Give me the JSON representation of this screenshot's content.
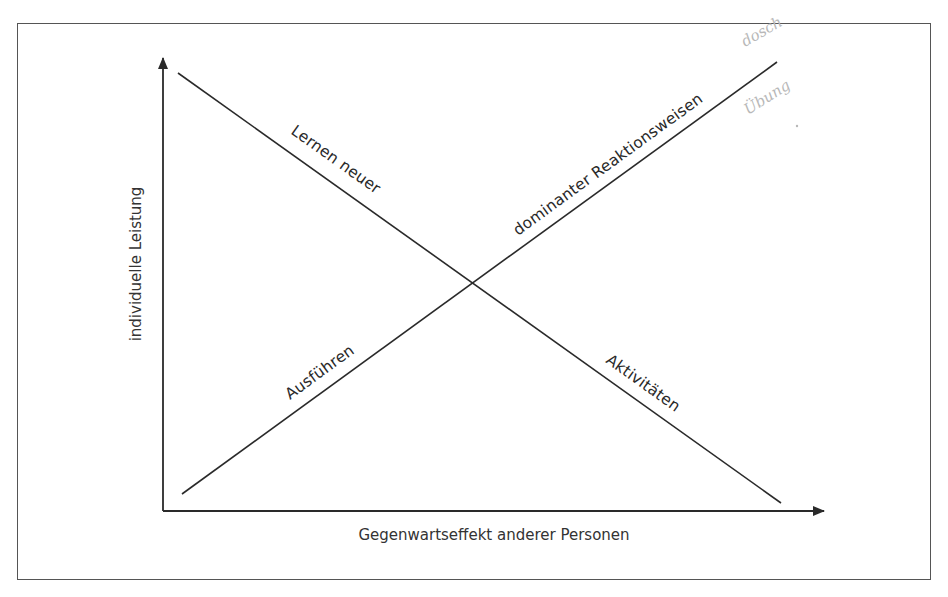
{
  "figure": {
    "x_axis_label": "Gegenwartseffekt anderer Personen",
    "y_axis_label": "individuelle Leistung",
    "lines": [
      {
        "id": "lernen",
        "label_upper": "Lernen neuer",
        "label_lower": "Aktivitäten",
        "full_label": "Lernen neuer Aktivitäten",
        "trend": "decreasing"
      },
      {
        "id": "ausfuehren",
        "label_lower": "Ausführen",
        "label_upper": "dominanter Reaktionsweisen",
        "full_label": "Ausführen dominanter Reaktionsweisen",
        "trend": "increasing"
      }
    ],
    "handwritten_note": {
      "line1": "dosch",
      "line2": "Übung"
    },
    "colors": {
      "line": "#2a2a2a",
      "frame": "#555555",
      "handwriting": "#b8b8b8",
      "background": "#ffffff"
    }
  }
}
